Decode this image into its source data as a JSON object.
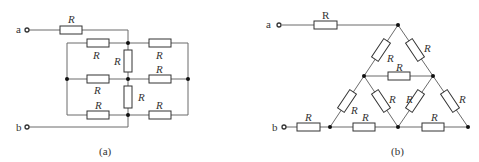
{
  "figure": {
    "panels": [
      {
        "id": "a",
        "caption": "(a)",
        "terminals": [
          "a",
          "b"
        ],
        "resistor_label": "R",
        "resistor_count": 10,
        "description": "Three-column ladder network: series R from terminal a to top-middle node; 3x2 grid of horizontal R between left rail, middle column and right rail; two vertical R in middle column; terminal b wired directly to bottom-middle node"
      },
      {
        "id": "b",
        "caption": "(b)",
        "terminals": [
          "a",
          "b"
        ],
        "resistor_label": "R",
        "resistor_count": 11,
        "description": "Triangular network of 9 R with 6 nodes; series R from terminal a to apex; series R from terminal b to bottom-left vertex"
      }
    ]
  },
  "labels": {
    "a": "a",
    "b": "b",
    "R": "R",
    "cap_a": "(a)",
    "cap_b": "(b)"
  }
}
